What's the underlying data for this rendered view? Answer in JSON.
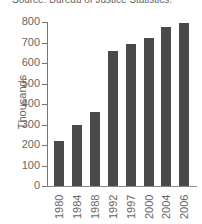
{
  "source_text": "Source: Bureau of Justice Statistics.",
  "chart_data": {
    "type": "bar",
    "title": "",
    "source": "Source: Bureau of Justice Statistics.",
    "xlabel": "",
    "ylabel": "Thousands",
    "categories": [
      "1980",
      "1984",
      "1988",
      "1992",
      "1997",
      "2000",
      "2004",
      "2006"
    ],
    "values": [
      220,
      300,
      360,
      660,
      695,
      720,
      775,
      795
    ],
    "ylim": [
      0,
      800
    ],
    "yticks": [
      "0",
      "100",
      "200",
      "300",
      "400",
      "500",
      "600",
      "700",
      "800"
    ],
    "grid": false,
    "legend": null,
    "bar_color": "#4a4a4a"
  }
}
